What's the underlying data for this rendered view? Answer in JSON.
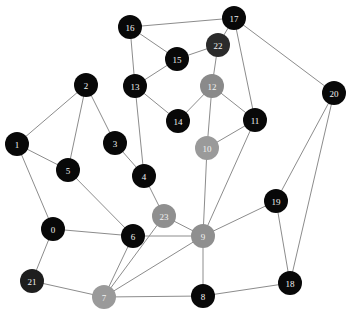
{
  "graph": {
    "type": "node-link-diagram",
    "background": "#ffffff",
    "edge_color": "#8c8c8c",
    "label_color": "#f2f2f2",
    "node_radius": 12,
    "node_count": 24,
    "edge_count": 38,
    "nodes": [
      {
        "id": "0",
        "label": "0",
        "x": 53,
        "y": 229,
        "r": 12,
        "color": "#080808"
      },
      {
        "id": "1",
        "label": "1",
        "x": 17,
        "y": 144,
        "r": 12,
        "color": "#080808"
      },
      {
        "id": "2",
        "label": "2",
        "x": 86,
        "y": 85,
        "r": 12,
        "color": "#080808"
      },
      {
        "id": "3",
        "label": "3",
        "x": 115,
        "y": 143,
        "r": 12,
        "color": "#080808"
      },
      {
        "id": "4",
        "label": "4",
        "x": 144,
        "y": 176,
        "r": 12,
        "color": "#080808"
      },
      {
        "id": "5",
        "label": "5",
        "x": 68,
        "y": 170,
        "r": 12,
        "color": "#080808"
      },
      {
        "id": "6",
        "label": "6",
        "x": 133,
        "y": 236,
        "r": 12,
        "color": "#080808"
      },
      {
        "id": "7",
        "label": "7",
        "x": 104,
        "y": 297,
        "r": 12,
        "color": "#9a9a9a"
      },
      {
        "id": "8",
        "label": "8",
        "x": 203,
        "y": 296,
        "r": 12,
        "color": "#080808"
      },
      {
        "id": "9",
        "label": "9",
        "x": 203,
        "y": 236,
        "r": 12,
        "color": "#8f8f8f"
      },
      {
        "id": "10",
        "label": "10",
        "x": 207,
        "y": 148,
        "r": 12,
        "color": "#9a9a9a"
      },
      {
        "id": "11",
        "label": "11",
        "x": 255,
        "y": 120,
        "r": 12,
        "color": "#080808"
      },
      {
        "id": "12",
        "label": "12",
        "x": 212,
        "y": 86,
        "r": 12,
        "color": "#8a8a8a"
      },
      {
        "id": "13",
        "label": "13",
        "x": 135,
        "y": 86,
        "r": 12,
        "color": "#080808"
      },
      {
        "id": "14",
        "label": "14",
        "x": 178,
        "y": 121,
        "r": 12,
        "color": "#080808"
      },
      {
        "id": "15",
        "label": "15",
        "x": 177,
        "y": 59,
        "r": 12,
        "color": "#080808"
      },
      {
        "id": "16",
        "label": "16",
        "x": 130,
        "y": 27,
        "r": 12,
        "color": "#080808"
      },
      {
        "id": "17",
        "label": "17",
        "x": 234,
        "y": 18,
        "r": 12,
        "color": "#080808"
      },
      {
        "id": "18",
        "label": "18",
        "x": 290,
        "y": 283,
        "r": 12,
        "color": "#080808"
      },
      {
        "id": "19",
        "label": "19",
        "x": 276,
        "y": 201,
        "r": 12,
        "color": "#080808"
      },
      {
        "id": "20",
        "label": "20",
        "x": 334,
        "y": 93,
        "r": 12,
        "color": "#080808"
      },
      {
        "id": "21",
        "label": "21",
        "x": 32,
        "y": 281,
        "r": 12,
        "color": "#1e1e1e"
      },
      {
        "id": "22",
        "label": "22",
        "x": 218,
        "y": 45,
        "r": 12,
        "color": "#2b2b2b"
      },
      {
        "id": "23",
        "label": "23",
        "x": 164,
        "y": 216,
        "r": 12,
        "color": "#8f8f8f"
      }
    ],
    "edges": [
      {
        "source": "16",
        "target": "17"
      },
      {
        "source": "16",
        "target": "15"
      },
      {
        "source": "16",
        "target": "13"
      },
      {
        "source": "17",
        "target": "22"
      },
      {
        "source": "17",
        "target": "20"
      },
      {
        "source": "17",
        "target": "11"
      },
      {
        "source": "15",
        "target": "22"
      },
      {
        "source": "15",
        "target": "13"
      },
      {
        "source": "22",
        "target": "12"
      },
      {
        "source": "12",
        "target": "14"
      },
      {
        "source": "12",
        "target": "10"
      },
      {
        "source": "12",
        "target": "11"
      },
      {
        "source": "13",
        "target": "14"
      },
      {
        "source": "13",
        "target": "4"
      },
      {
        "source": "10",
        "target": "11"
      },
      {
        "source": "10",
        "target": "9"
      },
      {
        "source": "11",
        "target": "9"
      },
      {
        "source": "20",
        "target": "19"
      },
      {
        "source": "20",
        "target": "18"
      },
      {
        "source": "19",
        "target": "9"
      },
      {
        "source": "19",
        "target": "18"
      },
      {
        "source": "18",
        "target": "8"
      },
      {
        "source": "9",
        "target": "23"
      },
      {
        "source": "9",
        "target": "8"
      },
      {
        "source": "9",
        "target": "7"
      },
      {
        "source": "9",
        "target": "6"
      },
      {
        "source": "23",
        "target": "4"
      },
      {
        "source": "23",
        "target": "7"
      },
      {
        "source": "8",
        "target": "7"
      },
      {
        "source": "7",
        "target": "21"
      },
      {
        "source": "7",
        "target": "6"
      },
      {
        "source": "6",
        "target": "0"
      },
      {
        "source": "6",
        "target": "5"
      },
      {
        "source": "0",
        "target": "21"
      },
      {
        "source": "0",
        "target": "1"
      },
      {
        "source": "5",
        "target": "1"
      },
      {
        "source": "5",
        "target": "2"
      },
      {
        "source": "4",
        "target": "3"
      },
      {
        "source": "3",
        "target": "2"
      },
      {
        "source": "2",
        "target": "1"
      }
    ]
  }
}
